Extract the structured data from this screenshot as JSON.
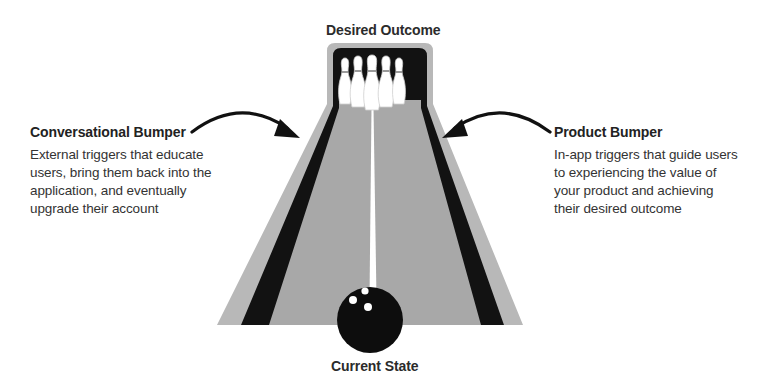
{
  "diagram": {
    "top_label": "Desired Outcome",
    "bottom_label": "Current State",
    "left": {
      "title": "Conversational Bumper",
      "description_lines": [
        "External triggers that educate",
        "users, bring them back into the",
        "application, and eventually",
        "upgrade their account"
      ]
    },
    "right": {
      "title": "Product Bumper",
      "description_lines": [
        "In-app triggers that guide users",
        "to experiencing the value of",
        "your product and achieving",
        "their desired outcome"
      ]
    },
    "icons": {
      "lane": "bowling-lane-icon",
      "pins": "bowling-pins-icon",
      "ball": "bowling-ball-icon",
      "left_arrow": "curved-arrow-right-icon",
      "right_arrow": "curved-arrow-left-icon"
    },
    "colors": {
      "lane_outer": "#b5b5b5",
      "lane_surface": "#a9a9a9",
      "gutter": "#111111",
      "center_line": "#ffffff",
      "ball": "#0d0d0d",
      "arrow": "#111111",
      "text": "#2b2b2b"
    }
  }
}
